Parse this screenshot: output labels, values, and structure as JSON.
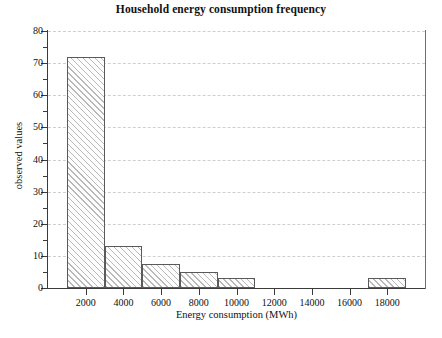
{
  "chart_data": {
    "type": "bar",
    "title": "Household energy consumption frequency",
    "xlabel": "Energy consumption (MWh)",
    "ylabel": "observed values",
    "xlim": [
      0,
      20000
    ],
    "ylim": [
      0,
      80
    ],
    "grid": true,
    "legend": null,
    "bin_width": 2000,
    "categories": [
      "1000-3000",
      "3000-5000",
      "5000-7000",
      "7000-9000",
      "9000-11000",
      "11000-13000",
      "13000-15000",
      "15000-17000",
      "17000-19000"
    ],
    "bin_edges": [
      1000,
      3000,
      5000,
      7000,
      9000,
      11000,
      13000,
      15000,
      17000,
      19000
    ],
    "bin_centers": [
      2000,
      4000,
      6000,
      8000,
      10000,
      12000,
      14000,
      16000,
      18000
    ],
    "values": [
      72,
      13,
      7.5,
      5,
      3,
      0,
      0,
      0,
      3
    ],
    "xticks": [
      2000,
      4000,
      6000,
      8000,
      10000,
      12000,
      14000,
      16000,
      18000
    ],
    "xtick_labels": [
      "2000",
      "4000",
      "6000",
      "8000",
      "10000",
      "12000",
      "14000",
      "16000",
      "18000"
    ],
    "yticks": [
      0,
      10,
      20,
      30,
      40,
      50,
      60,
      70,
      80
    ],
    "ytick_labels": [
      "0",
      "10",
      "20",
      "30",
      "40",
      "50",
      "60",
      "70",
      "80"
    ],
    "yticks_minor": [
      5,
      15,
      25,
      35,
      45,
      55,
      65,
      75
    ],
    "colors": {
      "bar_edge": "#5a5a5a",
      "bar_hatch": "#b9b9b9",
      "bar_face": "#fdfdfd",
      "axis": "#3a3a3a",
      "grid": "#cfcfcf",
      "text": "#111111",
      "background": "#ffffff"
    }
  }
}
